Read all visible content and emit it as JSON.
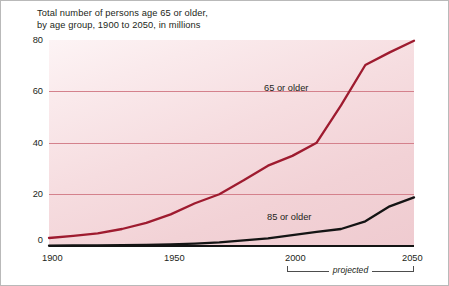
{
  "chart_data": {
    "type": "line",
    "title": "Total number of persons age 65 or older,\nby age group, 1900 to 2050, in millions",
    "xlabel": "",
    "ylabel": "",
    "xlim": [
      1900,
      2050
    ],
    "ylim": [
      0,
      80
    ],
    "grid": true,
    "gridlines_y": [
      20,
      40,
      60
    ],
    "y_ticks": [
      "0",
      "20",
      "40",
      "60",
      "80"
    ],
    "y_tick_values": [
      0,
      20,
      40,
      60,
      80
    ],
    "x_ticks": [
      "1900",
      "1950",
      "2000",
      "2050"
    ],
    "x_tick_values": [
      1900,
      1950,
      2000,
      2050
    ],
    "legend_position": "inline-annotation",
    "annotations": [
      {
        "text": "projected",
        "from_year": 2000,
        "to_year": 2050,
        "style": "bracket-below-axis"
      }
    ],
    "series": [
      {
        "name": "65 or older",
        "color": "#9e1b2f",
        "label_text": "65 or older",
        "x": [
          1900,
          1910,
          1920,
          1930,
          1940,
          1950,
          1960,
          1970,
          1980,
          1990,
          2000,
          2010,
          2020,
          2030,
          2040,
          2050
        ],
        "values": [
          3.1,
          3.9,
          4.9,
          6.6,
          9.0,
          12.3,
          16.6,
          20.1,
          25.5,
          31.2,
          35.0,
          40.1,
          54.6,
          70.3,
          75.2,
          79.7
        ]
      },
      {
        "name": "85 or older",
        "color": "#141414",
        "label_text": "85 or older",
        "x": [
          1900,
          1910,
          1920,
          1930,
          1940,
          1950,
          1960,
          1970,
          1980,
          1990,
          2000,
          2010,
          2020,
          2030,
          2040,
          2050
        ],
        "values": [
          0.1,
          0.2,
          0.2,
          0.3,
          0.4,
          0.6,
          0.9,
          1.4,
          2.2,
          3.0,
          4.2,
          5.5,
          6.6,
          9.6,
          15.4,
          18.9
        ]
      }
    ]
  },
  "colors": {
    "series_65": "#9e1b2f",
    "series_85": "#141414",
    "gridline": "#d4818c",
    "plot_background_light": "#fdf4f5",
    "plot_background_dark": "#efcbd0",
    "text": "#231f20",
    "frame_border": "#b9b9b9"
  }
}
